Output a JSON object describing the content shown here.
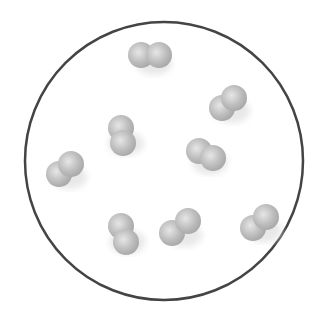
{
  "diagram": {
    "type": "particle-container",
    "container": {
      "cx": 164,
      "cy": 161,
      "r": 139,
      "stroke": "#444444"
    },
    "atom_color": "#b5b5b5",
    "atom_highlight": "#e6e6e6",
    "molecule_count": 8,
    "molecules": [
      {
        "a": [
          141,
          55
        ],
        "b": [
          159,
          55
        ]
      },
      {
        "a": [
          222,
          108
        ],
        "b": [
          234,
          98
        ]
      },
      {
        "a": [
          121,
          128
        ],
        "b": [
          123,
          143
        ]
      },
      {
        "a": [
          199,
          151
        ],
        "b": [
          213,
          158
        ]
      },
      {
        "a": [
          59,
          174
        ],
        "b": [
          71,
          164
        ]
      },
      {
        "a": [
          121,
          226
        ],
        "b": [
          126,
          242
        ]
      },
      {
        "a": [
          172,
          233
        ],
        "b": [
          188,
          221
        ]
      },
      {
        "a": [
          253,
          228
        ],
        "b": [
          266,
          217
        ]
      }
    ]
  }
}
